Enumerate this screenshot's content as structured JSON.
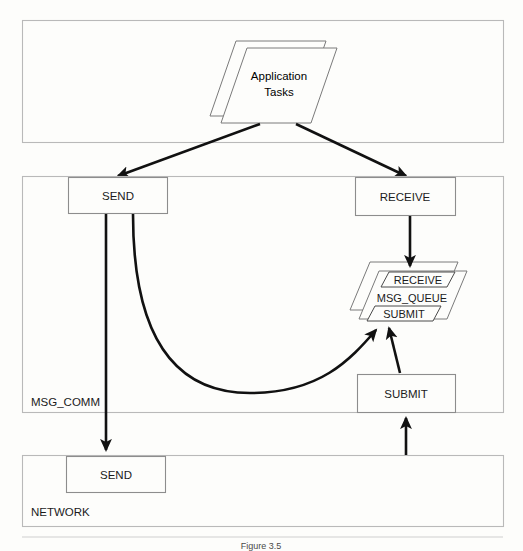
{
  "figure": {
    "caption_prefix": "Figure 3.5",
    "caption_text": "Relation of MSG_COMM to avoid lines the communication subsystem (NETWORK)"
  },
  "layers": [
    {
      "id": "application",
      "label": "",
      "label_visible": false
    },
    {
      "id": "msg_comm",
      "label": "MSG_COMM",
      "label_visible": true
    },
    {
      "id": "network",
      "label": "NETWORK",
      "label_visible": true
    }
  ],
  "application_layer": {
    "task_stack": {
      "name": "application-tasks-stack",
      "line1": "Application",
      "line2": "Tasks",
      "sheet_count": 2
    }
  },
  "msg_comm_layer": {
    "layer_label": "MSG_COMM",
    "nodes": [
      {
        "id": "send",
        "label": "SEND"
      },
      {
        "id": "receive",
        "label": "RECEIVE"
      },
      {
        "id": "submit",
        "label": "SUBMIT"
      }
    ],
    "queue_stack": {
      "name": "msg-queue-stack",
      "label": "MSG_QUEUE",
      "top_slot": "RECEIVE",
      "bottom_slot": "SUBMIT",
      "sheet_count": 2
    }
  },
  "network_layer": {
    "layer_label": "NETWORK",
    "nodes": [
      {
        "id": "network-send",
        "label": "SEND"
      }
    ]
  },
  "connectors": [
    {
      "id": "app-to-send",
      "from": "application-tasks",
      "to": "send",
      "style": "arrow"
    },
    {
      "id": "app-to-receive",
      "from": "application-tasks",
      "to": "receive",
      "style": "arrow"
    },
    {
      "id": "send-to-network-send",
      "from": "send",
      "to": "network-send",
      "style": "arrow"
    },
    {
      "id": "send-to-msg-queue",
      "from": "send",
      "to": "msg-queue-submit",
      "style": "curved-arrow"
    },
    {
      "id": "receive-to-msg-queue",
      "from": "receive",
      "to": "msg-queue-receive",
      "style": "arrow"
    },
    {
      "id": "submit-to-msg-queue",
      "from": "submit",
      "to": "msg-queue-submit",
      "style": "arrow"
    },
    {
      "id": "network-to-submit",
      "from": "network",
      "to": "submit",
      "style": "arrow"
    }
  ],
  "colors": {
    "page_background": "#fdfdfb",
    "frame_stroke": "#b9b9b9",
    "node_stroke": "#8d8d8d",
    "arrow_stroke": "#111111",
    "text": "#1b1b1b"
  }
}
